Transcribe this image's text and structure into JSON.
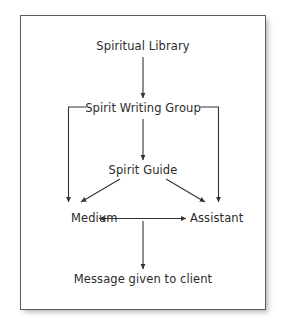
{
  "figure": {
    "background_color": "#ffffff",
    "frame_border_color": "#5d5d5d",
    "text_color": "#2b2b2b",
    "connector_color": "#333333"
  },
  "nodes": [
    {
      "id": "spiritual-library",
      "label": "Spiritual Library"
    },
    {
      "id": "spirit-writing-group",
      "label": "Spirit Writing Group"
    },
    {
      "id": "spirit-guide",
      "label": "Spirit Guide"
    },
    {
      "id": "medium",
      "label": "Medium"
    },
    {
      "id": "assistant",
      "label": "Assistant"
    },
    {
      "id": "message",
      "label": "Message given to client"
    }
  ],
  "edges": [
    {
      "from": "spiritual-library",
      "to": "spirit-writing-group",
      "style": "straight-vertical",
      "arrows": "single"
    },
    {
      "from": "spirit-writing-group",
      "to": "spirit-guide",
      "style": "straight-vertical",
      "arrows": "single"
    },
    {
      "from": "spirit-writing-group",
      "to": "medium",
      "style": "bracket-left",
      "arrows": "single"
    },
    {
      "from": "spirit-writing-group",
      "to": "assistant",
      "style": "bracket-right",
      "arrows": "single"
    },
    {
      "from": "spirit-guide",
      "to": "medium",
      "style": "diagonal",
      "arrows": "single"
    },
    {
      "from": "spirit-guide",
      "to": "assistant",
      "style": "diagonal",
      "arrows": "single"
    },
    {
      "from": "medium",
      "to": "assistant",
      "style": "straight-horizontal",
      "arrows": "double"
    },
    {
      "from": "medium-assistant-link",
      "to": "message",
      "style": "straight-vertical",
      "arrows": "single"
    }
  ]
}
